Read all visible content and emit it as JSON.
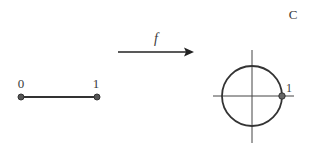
{
  "diagram": {
    "interval": {
      "start_label": "0",
      "end_label": "1"
    },
    "map": {
      "function_label": "f"
    },
    "circle": {
      "set_label": "C",
      "point_label": "1"
    },
    "colors": {
      "stroke": "#333333",
      "point_fill": "#555555"
    }
  }
}
